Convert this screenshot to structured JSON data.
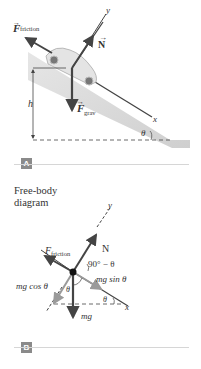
{
  "panel_a": {
    "badge": "A",
    "labels": {
      "friction_F": "F",
      "friction_sub": "friction",
      "normal": "N",
      "grav_F": "F",
      "grav_sub": "grav",
      "axis_y": "y",
      "axis_x": "x",
      "height": "h",
      "angle": "θ"
    }
  },
  "panel_b": {
    "title_line1": "Free-body",
    "title_line2": "diagram",
    "badge": "B",
    "labels": {
      "friction_F": "F",
      "friction_sub": "friction",
      "normal": "N",
      "axis_y": "y",
      "axis_x": "x",
      "complement_angle": "90° − θ",
      "mg_sin": "mg sin θ",
      "mg_cos": "mg cos θ",
      "mg": "mg",
      "theta_inner": "θ",
      "theta_x": "θ"
    }
  },
  "colors": {
    "arrow_dark": "#444444",
    "arrow_gray": "#9a9a9a",
    "ramp": "#d8d8d8",
    "badge": "#8a8a8a"
  }
}
